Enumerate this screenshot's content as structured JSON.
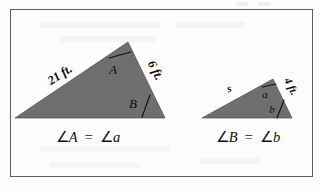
{
  "figure": {
    "border_color": "#5d5d5d",
    "triangle_fill": "#6f6f6f",
    "background": "#fdfdfd",
    "left_triangle": {
      "name": "large-triangle",
      "side_left_label": "21 ft.",
      "side_right_label": "6 ft.",
      "angle_apex_label": "A",
      "angle_right_label": "B"
    },
    "right_triangle": {
      "name": "small-triangle",
      "side_left_label": "s",
      "side_right_label": "4 ft.",
      "angle_apex_label": "a",
      "angle_right_label": "b"
    },
    "captions": {
      "left": {
        "full": "∠A = ∠a",
        "angle_symbol_1": "∠",
        "term_1": "A",
        "equals": "=",
        "angle_symbol_2": "∠",
        "term_2": "a"
      },
      "right": {
        "full": "∠B = ∠b",
        "angle_symbol_1": "∠",
        "term_1": "B",
        "equals": "=",
        "angle_symbol_2": "∠",
        "term_2": "b"
      }
    }
  }
}
